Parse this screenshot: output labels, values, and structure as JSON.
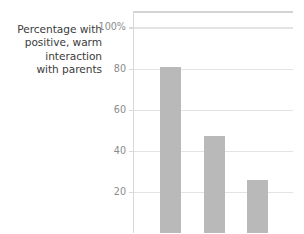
{
  "figure": {
    "axis_label_lines": [
      "Percentage with",
      "positive, warm",
      "interaction",
      "with parents"
    ]
  },
  "chart_data": {
    "type": "bar",
    "title": "",
    "xlabel": "",
    "ylabel": "Percentage with positive, warm interaction with parents",
    "categories": [
      "",
      "",
      ""
    ],
    "values": [
      81,
      47,
      26
    ],
    "ylim": [
      0,
      108
    ],
    "yticks": [
      20,
      40,
      60,
      80,
      100
    ],
    "ytick_labels": [
      "20",
      "40",
      "60",
      "80",
      "100%"
    ],
    "grid": true,
    "legend": "none",
    "bar_color": "#b9b9b9",
    "gridline_color": "#e3e3e3",
    "tick_label_color": "#8b8b8b",
    "label_color": "#3b3b3b"
  }
}
